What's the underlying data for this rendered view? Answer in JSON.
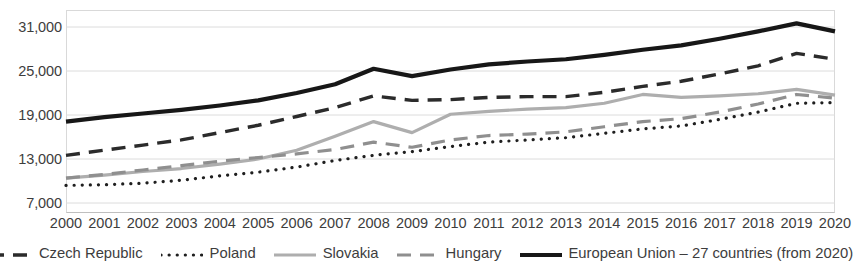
{
  "chart_data": {
    "type": "line",
    "title": "",
    "xlabel": "",
    "ylabel": "",
    "x": [
      2000,
      2001,
      2002,
      2003,
      2004,
      2005,
      2006,
      2007,
      2008,
      2009,
      2010,
      2011,
      2012,
      2013,
      2014,
      2015,
      2016,
      2017,
      2018,
      2019,
      2020
    ],
    "categories": [
      "2000",
      "2001",
      "2002",
      "2003",
      "2004",
      "2005",
      "2006",
      "2007",
      "2008",
      "2009",
      "2010",
      "2011",
      "2012",
      "2013",
      "2014",
      "2015",
      "2016",
      "2017",
      "2018",
      "2019",
      "2020"
    ],
    "ylim": [
      7000,
      31000
    ],
    "yticks": [
      7000,
      13000,
      19000,
      25000,
      31000
    ],
    "ytick_labels": [
      "7,000",
      "13,000",
      "19,000",
      "25,000",
      "31,000"
    ],
    "grid": true,
    "legend_position": "bottom",
    "series": [
      {
        "name": "Czech Republic",
        "color": "#2b2b2b",
        "style": "dashed",
        "width": 3.4,
        "values": [
          13500,
          14200,
          14900,
          15600,
          16600,
          17600,
          18800,
          20000,
          21600,
          21000,
          21100,
          21400,
          21500,
          21500,
          22100,
          22900,
          23600,
          24600,
          25700,
          27400,
          26600
        ]
      },
      {
        "name": "Poland",
        "color": "#1f1f1f",
        "style": "dotted",
        "width": 3.2,
        "values": [
          9400,
          9500,
          9700,
          10100,
          10700,
          11200,
          11900,
          12800,
          13500,
          14000,
          14700,
          15300,
          15600,
          15900,
          16500,
          17100,
          17500,
          18400,
          19400,
          20600,
          20700
        ]
      },
      {
        "name": "Slovakia",
        "color": "#aeaeae",
        "style": "solid",
        "width": 3.2,
        "values": [
          10400,
          10800,
          11300,
          11700,
          12300,
          13000,
          14200,
          16100,
          18100,
          16600,
          19100,
          19500,
          19800,
          20000,
          20600,
          21800,
          21400,
          21600,
          21900,
          22500,
          21700
        ]
      },
      {
        "name": "Hungary",
        "color": "#8f8f8f",
        "style": "dashed",
        "width": 3.2,
        "values": [
          10400,
          10900,
          11500,
          12100,
          12700,
          13200,
          13700,
          14300,
          15300,
          14600,
          15600,
          16200,
          16400,
          16700,
          17400,
          18100,
          18500,
          19400,
          20500,
          21800,
          21300
        ]
      },
      {
        "name": "European Union – 27 countries (from 2020)",
        "color": "#171717",
        "style": "solid",
        "width": 4.2,
        "values": [
          18100,
          18700,
          19200,
          19700,
          20300,
          21000,
          22000,
          23200,
          25300,
          24300,
          25200,
          25900,
          26300,
          26600,
          27200,
          27900,
          28500,
          29400,
          30400,
          31500,
          30400
        ]
      }
    ]
  },
  "legend": {
    "items": [
      {
        "label": "Czech Republic",
        "swatch": "dash-dark"
      },
      {
        "label": "Poland",
        "swatch": "dot-dark"
      },
      {
        "label": "Slovakia",
        "swatch": "solid-lightgray"
      },
      {
        "label": "Hungary",
        "swatch": "dash-gray"
      },
      {
        "label": "European Union – 27 countries (from 2020)",
        "swatch": "solid-black"
      }
    ]
  },
  "colors": {
    "czech": "#2b2b2b",
    "poland": "#1f1f1f",
    "slovakia": "#aeaeae",
    "hungary": "#8f8f8f",
    "eu": "#171717",
    "grid": "#dcdcdc",
    "axis": "#bfbfbf",
    "text": "#3d3d3d"
  }
}
